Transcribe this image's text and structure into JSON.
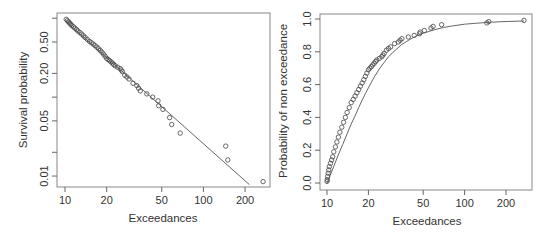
{
  "chart_data": [
    {
      "type": "scatter",
      "title": "",
      "xlabel": "Exceedances",
      "ylabel": "Survival probability",
      "xscale": "log",
      "yscale": "log",
      "xticks": [
        10,
        20,
        50,
        100,
        200
      ],
      "xtick_labels": [
        "10",
        "20",
        "50",
        "100",
        "200"
      ],
      "yticks": [
        0.01,
        0.02,
        0.05,
        0.1,
        0.2,
        0.5,
        1.0
      ],
      "ytick_labels": [
        "0.01",
        "",
        "0.05",
        "",
        "0.20",
        "0.50",
        ""
      ],
      "xlim": [
        9.3,
        300
      ],
      "ylim": [
        0.0075,
        1.15
      ],
      "grid": false,
      "series": [
        {
          "name": "empirical",
          "style": "open-circles",
          "x": [
            10.2,
            10.4,
            10.6,
            10.8,
            11.0,
            11.2,
            11.5,
            11.8,
            12.1,
            12.4,
            12.8,
            13.2,
            13.6,
            14.0,
            14.5,
            15.0,
            15.5,
            16.0,
            16.5,
            17.0,
            17.5,
            18.0,
            18.5,
            19.0,
            19.5,
            20.0,
            20.5,
            21.0,
            21.5,
            22.0,
            22.5,
            23.0,
            24.0,
            25.0,
            25.5,
            26.0,
            27.0,
            28.0,
            29.0,
            31.0,
            33.0,
            34.0,
            35.0,
            39.0,
            43.0,
            47.0,
            47.5,
            51.0,
            57.0,
            59.0,
            68.0,
            145.0,
            150.0,
            270.0
          ],
          "y": [
            0.97,
            0.93,
            0.9,
            0.87,
            0.84,
            0.81,
            0.78,
            0.75,
            0.72,
            0.69,
            0.66,
            0.63,
            0.6,
            0.57,
            0.54,
            0.51,
            0.49,
            0.47,
            0.45,
            0.43,
            0.41,
            0.39,
            0.37,
            0.35,
            0.33,
            0.31,
            0.3,
            0.29,
            0.28,
            0.27,
            0.26,
            0.25,
            0.24,
            0.23,
            0.22,
            0.21,
            0.19,
            0.18,
            0.17,
            0.15,
            0.14,
            0.13,
            0.12,
            0.11,
            0.1,
            0.09,
            0.078,
            0.07,
            0.055,
            0.045,
            0.035,
            0.024,
            0.016,
            0.0085
          ]
        },
        {
          "name": "fitted",
          "style": "line",
          "x": [
            10,
            215
          ],
          "y": [
            0.93,
            0.0078
          ]
        }
      ]
    },
    {
      "type": "scatter",
      "title": "",
      "xlabel": "Exceedances",
      "ylabel": "Probability of non exceedance",
      "xscale": "log",
      "yscale": "linear",
      "xticks": [
        10,
        20,
        50,
        100,
        200
      ],
      "xtick_labels": [
        "10",
        "20",
        "50",
        "100",
        "200"
      ],
      "yticks": [
        0.0,
        0.2,
        0.4,
        0.6,
        0.8,
        1.0
      ],
      "ytick_labels": [
        "0.0",
        "0.2",
        "0.4",
        "0.6",
        "0.8",
        "1.0"
      ],
      "xlim": [
        9.3,
        300
      ],
      "ylim": [
        -0.03,
        1.03
      ],
      "grid": false,
      "series": [
        {
          "name": "empirical",
          "style": "open-circles",
          "x": [
            10.0,
            10.05,
            10.1,
            10.2,
            10.3,
            10.4,
            10.6,
            10.8,
            11.0,
            11.2,
            11.5,
            11.8,
            12.1,
            12.4,
            12.8,
            13.2,
            13.6,
            14.0,
            14.5,
            15.0,
            15.5,
            16.0,
            16.5,
            17.0,
            17.5,
            18.0,
            18.5,
            19.0,
            19.5,
            20.0,
            20.5,
            21.0,
            21.5,
            22.0,
            22.5,
            23.0,
            24.0,
            25.0,
            25.5,
            26.0,
            27.0,
            28.0,
            29.0,
            31.0,
            33.0,
            34.0,
            35.0,
            39.0,
            43.0,
            47.0,
            47.5,
            51.0,
            57.0,
            59.0,
            68.0,
            145.0,
            150.0,
            270.0
          ],
          "y": [
            0.01,
            0.02,
            0.04,
            0.06,
            0.08,
            0.1,
            0.12,
            0.14,
            0.16,
            0.19,
            0.22,
            0.25,
            0.28,
            0.31,
            0.34,
            0.37,
            0.4,
            0.43,
            0.46,
            0.49,
            0.51,
            0.53,
            0.55,
            0.57,
            0.59,
            0.61,
            0.63,
            0.65,
            0.67,
            0.69,
            0.7,
            0.71,
            0.72,
            0.73,
            0.74,
            0.75,
            0.76,
            0.77,
            0.78,
            0.79,
            0.81,
            0.82,
            0.83,
            0.85,
            0.86,
            0.87,
            0.88,
            0.89,
            0.9,
            0.91,
            0.92,
            0.93,
            0.945,
            0.955,
            0.965,
            0.976,
            0.984,
            0.9915
          ]
        },
        {
          "name": "fitted",
          "style": "line",
          "function": "gpd-cdf",
          "x": [
            10,
            11,
            12,
            13,
            14,
            15,
            16,
            17,
            18,
            19,
            20,
            22,
            24,
            26,
            28,
            30,
            35,
            40,
            45,
            50,
            60,
            70,
            80,
            100,
            120,
            150,
            200,
            270
          ],
          "y": [
            0.0,
            0.085,
            0.165,
            0.235,
            0.3,
            0.36,
            0.41,
            0.46,
            0.505,
            0.545,
            0.58,
            0.645,
            0.695,
            0.735,
            0.77,
            0.795,
            0.845,
            0.875,
            0.898,
            0.913,
            0.934,
            0.948,
            0.957,
            0.968,
            0.974,
            0.98,
            0.985,
            0.988
          ]
        }
      ]
    }
  ],
  "plots": [
    {
      "xlabel": "Exceedances",
      "ylabel": "Survival probability"
    },
    {
      "xlabel": "Exceedances",
      "ylabel": "Probability of non exceedance"
    }
  ]
}
